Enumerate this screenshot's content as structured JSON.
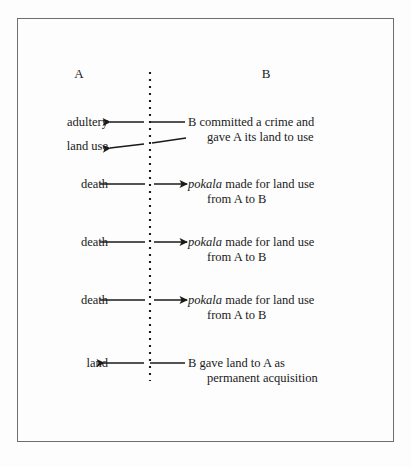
{
  "figure": {
    "type": "exchange-flow-diagram",
    "columns": {
      "left_header": "A",
      "right_header": "B"
    },
    "divider": {
      "style": "dotted-vertical",
      "color": "#1a1a1a"
    },
    "rows": [
      {
        "id": "row-adultery",
        "left_label": "adultery",
        "direction": "left",
        "right_text_line1": "B committed a crime and",
        "right_text_line2": "gave A its land to use",
        "right_term": "",
        "y": 122
      },
      {
        "id": "row-land-use",
        "left_label": "land use",
        "direction": "left",
        "right_text_line1": "",
        "right_text_line2": "",
        "right_term": "",
        "y": 146
      },
      {
        "id": "row-death-1",
        "left_label": "death",
        "direction": "right",
        "right_term": "pokala",
        "right_text_line1": " made for land use",
        "right_text_line2": "from A to B",
        "y": 184
      },
      {
        "id": "row-death-2",
        "left_label": "death",
        "direction": "right",
        "right_term": "pokala",
        "right_text_line1": " made for land use",
        "right_text_line2": "from A to B",
        "y": 242
      },
      {
        "id": "row-death-3",
        "left_label": "death",
        "direction": "right",
        "right_term": "pokala",
        "right_text_line1": " made for land use",
        "right_text_line2": "from A to B",
        "y": 300
      },
      {
        "id": "row-land",
        "left_label": "land",
        "direction": "left",
        "right_term": "",
        "right_text_line1": "B gave land to A as",
        "right_text_line2": "permanent  acquisition",
        "y": 363
      }
    ]
  }
}
